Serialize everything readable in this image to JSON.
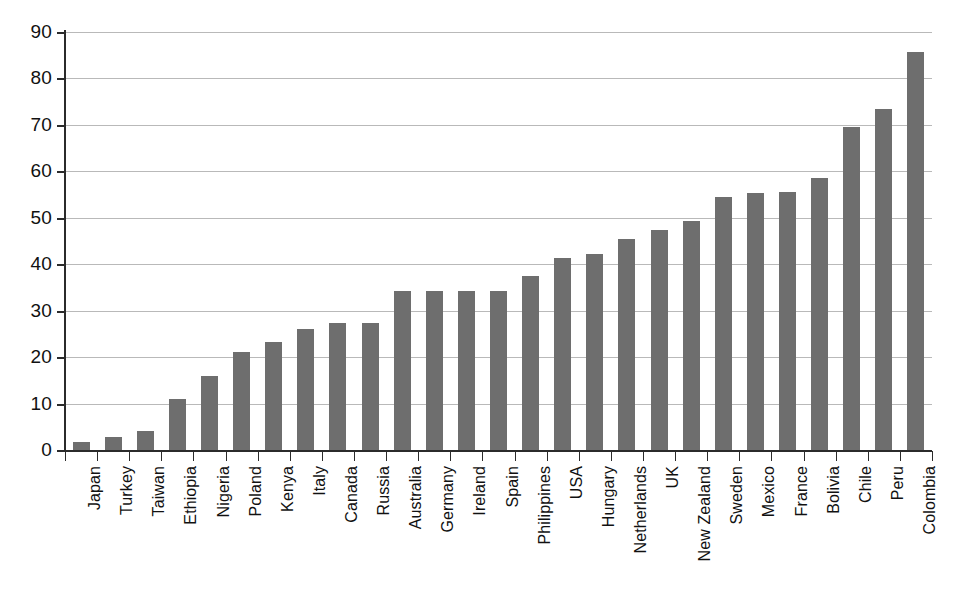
{
  "chart_data": {
    "type": "bar",
    "title": "",
    "subtitle": "",
    "xlabel": "",
    "ylabel": "",
    "ylim": [
      0,
      90
    ],
    "ytick_step": 10,
    "yticks": [
      0,
      10,
      20,
      30,
      40,
      50,
      60,
      70,
      80,
      90
    ],
    "grid": true,
    "grid_axis": "y",
    "legend": null,
    "legend_position": "none",
    "bar_color": "#6e6e6e",
    "axis_color": "#2b2b2b",
    "gridline_color": "#b9b9b9",
    "background_color": "#ffffff",
    "categories": [
      "Japan",
      "Turkey",
      "Taiwan",
      "Ethiopia",
      "Nigeria",
      "Poland",
      "Kenya",
      "Italy",
      "Canada",
      "Russia",
      "Australia",
      "Germany",
      "Ireland",
      "Spain",
      "Philippines",
      "USA",
      "Hungary",
      "Netherlands",
      "UK",
      "New Zealand",
      "Sweden",
      "Mexico",
      "France",
      "Bolivia",
      "Chile",
      "Peru",
      "Colombia"
    ],
    "values": [
      1.8,
      2.8,
      4.0,
      11.0,
      16.0,
      21.1,
      23.2,
      26.0,
      27.3,
      27.3,
      34.2,
      34.2,
      34.2,
      34.2,
      37.4,
      41.3,
      42.3,
      45.4,
      47.4,
      49.4,
      54.4,
      55.4,
      55.5,
      58.5,
      69.6,
      73.5,
      85.7
    ]
  }
}
